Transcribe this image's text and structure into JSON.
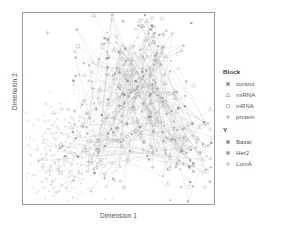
{
  "axes": {
    "xlabel": "Dimension 1",
    "ylabel": "Dimension 2"
  },
  "legends": {
    "block": {
      "title": "Block",
      "items": [
        {
          "label": "control",
          "marker": "filled-square-icon",
          "color": "#8a8a8a"
        },
        {
          "label": "miRNA",
          "marker": "triangle-icon",
          "color": "#9a9a9a"
        },
        {
          "label": "mRNA",
          "marker": "open-circle-icon",
          "color": "#9a9a9a"
        },
        {
          "label": "protein",
          "marker": "plus-icon",
          "color": "#9a9a9a"
        }
      ]
    },
    "y": {
      "title": "Y",
      "items": [
        {
          "label": "Basal",
          "marker": "filled-square-icon",
          "color": "#8f8f8f"
        },
        {
          "label": "Her2",
          "marker": "filled-square-icon",
          "color": "#9b9b9b"
        },
        {
          "label": "LumA",
          "marker": "plus-icon",
          "color": "#b0b0b0"
        }
      ]
    }
  },
  "chart_data": {
    "type": "scatter",
    "title": "",
    "xlabel": "Dimension 1",
    "ylabel": "Dimension 2",
    "xlim": [
      0,
      1
    ],
    "ylim": [
      0,
      1
    ],
    "grid": false,
    "legend_position": "right",
    "series": [
      {
        "name": "network-cluster",
        "color": "#8d8d8d",
        "marker": "mixed",
        "n_points": 420,
        "region": "center-right",
        "x_range": [
          0.3,
          0.98
        ],
        "y_range": [
          0.05,
          0.98
        ]
      },
      {
        "name": "light-cluster",
        "color": "#cfcfcf",
        "marker": "point",
        "n_points": 520,
        "region": "lower-left",
        "x_range": [
          0.03,
          0.45
        ],
        "y_range": [
          0.02,
          0.58
        ]
      }
    ],
    "edges": {
      "count": 310,
      "color": "#b4b4b4",
      "width": 0.35
    }
  }
}
